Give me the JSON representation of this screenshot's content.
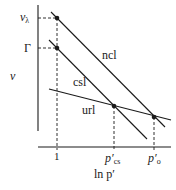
{
  "diagram": {
    "type": "critical-state-lines",
    "axes": {
      "y_label": "v",
      "x_label": "ln p′",
      "y_ticks": [
        {
          "label_base": "v",
          "label_sub": "λ",
          "y": 18
        },
        {
          "label_base": "Γ",
          "label_sub": "",
          "y": 48
        }
      ],
      "x_ticks": [
        {
          "label_base": "1",
          "label_sub": "",
          "x": 57
        },
        {
          "label_base": "p′",
          "label_sub": "cs",
          "x": 114
        },
        {
          "label_base": "p′",
          "label_sub": "o",
          "x": 154
        }
      ]
    },
    "lines": [
      {
        "name": "ncl",
        "label": "ncl"
      },
      {
        "name": "csl",
        "label": "csl"
      },
      {
        "name": "url",
        "label": "url"
      }
    ],
    "points": [
      {
        "name": "v-lambda-point"
      },
      {
        "name": "gamma-point"
      },
      {
        "name": "p-cs-point"
      },
      {
        "name": "p-o-point"
      }
    ],
    "colors": {
      "ink": "#1a1a1a",
      "background": "#ffffff"
    }
  }
}
